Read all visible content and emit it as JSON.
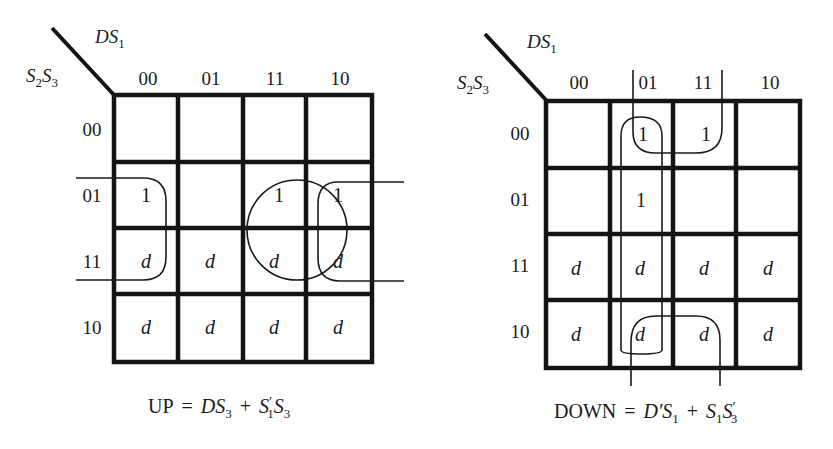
{
  "maps": [
    {
      "id": "up",
      "row_var": "S2S3",
      "col_var": "DS1",
      "col_labels": [
        "00",
        "01",
        "11",
        "10"
      ],
      "row_labels": [
        "00",
        "01",
        "11",
        "10"
      ],
      "cells": [
        [
          "",
          "",
          "",
          ""
        ],
        [
          "1",
          "",
          "1",
          "1"
        ],
        [
          "d",
          "d",
          "d",
          "d"
        ],
        [
          "d",
          "d",
          "d",
          "d"
        ]
      ],
      "equation": {
        "lhs": "UP",
        "rhs": "DS3 + S1'S3"
      },
      "groups": [
        "DS3 (circle over cols 11,10 rows 01,11)",
        "S1'S3 (wrap-around cols 00 and 10, rows 01,11)"
      ]
    },
    {
      "id": "down",
      "row_var": "S2S3",
      "col_var": "DS1",
      "col_labels": [
        "00",
        "01",
        "11",
        "10"
      ],
      "row_labels": [
        "00",
        "01",
        "11",
        "10"
      ],
      "cells": [
        [
          "",
          "1",
          "1",
          ""
        ],
        [
          "",
          "1",
          "",
          ""
        ],
        [
          "d",
          "d",
          "d",
          "d"
        ],
        [
          "d",
          "d",
          "d",
          "d"
        ]
      ],
      "equation": {
        "lhs": "DOWN",
        "rhs": "D'S1 + S1S3'"
      },
      "groups": [
        "D'S1 (column 01)",
        "S1S3' (wrap-around cols 01,11 rows 00 and 10)"
      ]
    }
  ],
  "text": {
    "up_eq": {
      "lhs": "UP",
      "eq": "=",
      "t1": "DS",
      "t1sub": "3",
      "plus": "+",
      "t2a": "S",
      "t2a_prime": "′",
      "t2a_sub": "1",
      "t2b": "S",
      "t2b_sub": "3"
    },
    "down_eq": {
      "lhs": "DOWN",
      "eq": "=",
      "t1a": "D′S",
      "t1_sub": "1",
      "plus": "+",
      "t2a": "S",
      "t2a_sub": "1",
      "t2b": "S",
      "t2b_prime": "′",
      "t2b_sub": "3"
    },
    "col_var": {
      "main": "DS",
      "sub": "1"
    },
    "row_var": {
      "a": "S",
      "a_sub": "2",
      "b": "S",
      "b_sub": "3"
    }
  }
}
